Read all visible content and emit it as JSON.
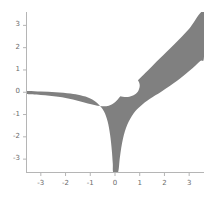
{
  "chart_data": {
    "type": "area",
    "title": "",
    "subtitle": "",
    "xlabel": "",
    "ylabel": "",
    "xlim": [
      -3.6,
      3.6
    ],
    "ylim": [
      -3.6,
      3.6
    ],
    "grid": false,
    "legend": null,
    "legend_position": "none",
    "xticks": [
      -3,
      -2,
      -1,
      0,
      1,
      2,
      3
    ],
    "xtick_labels": [
      "-3",
      "-2",
      "-1",
      "0",
      "1",
      "2",
      "3"
    ],
    "yticks": [
      -3,
      -2,
      -1,
      0,
      1,
      2,
      3
    ],
    "ytick_labels": [
      "-3",
      "-2",
      "-1",
      "0",
      "1",
      "2",
      "3"
    ],
    "fill_color": "#808080",
    "axis_color": "#b5b5b5",
    "tick_label_color": "#6b6b6b",
    "background_color": "#ffffff",
    "series": [
      {
        "name": "outer-band-region",
        "type": "filled-implicit-region",
        "asymptote_directions": [
          "left along y=0",
          "down along x=0",
          "up-right along y=x"
        ],
        "outer_boundary_points": [
          [
            -3.6,
            0.05
          ],
          [
            -3.0,
            0.03
          ],
          [
            -2.4,
            0.0
          ],
          [
            -1.8,
            -0.06
          ],
          [
            -1.4,
            -0.14
          ],
          [
            -1.0,
            -0.28
          ],
          [
            -0.7,
            -0.5
          ],
          [
            -0.45,
            -0.85
          ],
          [
            -0.3,
            -1.3
          ],
          [
            -0.2,
            -1.9
          ],
          [
            -0.13,
            -2.6
          ],
          [
            -0.09,
            -3.2
          ],
          [
            -0.07,
            -3.6
          ],
          [
            0.12,
            -3.6
          ],
          [
            0.2,
            -2.9
          ],
          [
            0.32,
            -2.1
          ],
          [
            0.5,
            -1.45
          ],
          [
            0.75,
            -0.95
          ],
          [
            1.05,
            -0.6
          ],
          [
            1.4,
            -0.3
          ],
          [
            1.9,
            0.05
          ],
          [
            2.5,
            0.5
          ],
          [
            3.0,
            0.95
          ],
          [
            3.45,
            1.4
          ],
          [
            3.6,
            1.6
          ],
          [
            3.6,
            3.6
          ],
          [
            3.0,
            2.85
          ],
          [
            2.4,
            2.15
          ],
          [
            1.8,
            1.5
          ],
          [
            1.35,
            1.0
          ],
          [
            1.0,
            0.62
          ],
          [
            0.7,
            0.3
          ],
          [
            0.42,
            0.03
          ],
          [
            0.2,
            -0.2
          ],
          [
            0.0,
            -0.45
          ],
          [
            -0.25,
            -0.6
          ],
          [
            -0.6,
            -0.62
          ],
          [
            -1.1,
            -0.5
          ],
          [
            -1.7,
            -0.32
          ],
          [
            -2.3,
            -0.2
          ],
          [
            -3.0,
            -0.12
          ],
          [
            -3.6,
            -0.08
          ]
        ],
        "hole_boundary_points": [
          [
            0.18,
            0.72
          ],
          [
            0.45,
            0.78
          ],
          [
            0.72,
            0.72
          ],
          [
            0.92,
            0.55
          ],
          [
            1.0,
            0.32
          ],
          [
            0.95,
            0.08
          ],
          [
            0.8,
            -0.1
          ],
          [
            0.58,
            -0.2
          ],
          [
            0.32,
            -0.2
          ],
          [
            0.08,
            -0.1
          ],
          [
            -0.08,
            0.1
          ],
          [
            -0.12,
            0.35
          ],
          [
            -0.02,
            0.58
          ],
          [
            0.18,
            0.72
          ]
        ]
      }
    ]
  },
  "axes": {
    "has_left_spine": true,
    "has_bottom_spine": true,
    "has_top_spine": false,
    "has_right_spine": false
  }
}
